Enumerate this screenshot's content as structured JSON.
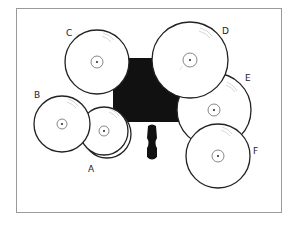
{
  "diagram": {
    "type": "drum-kit-cymbal-layout",
    "colors": {
      "outline": "#222222",
      "fill": "#ffffff",
      "drum_mass": "#111111",
      "frame": "#9a9a9a",
      "groove": "#bbbbbb"
    },
    "cymbals": [
      {
        "label": "A",
        "cx": 104,
        "cy": 131,
        "r": 24,
        "double": true
      },
      {
        "label": "B",
        "cx": 62,
        "cy": 124,
        "r": 28
      },
      {
        "label": "C",
        "cx": 97,
        "cy": 62,
        "r": 32
      },
      {
        "label": "D",
        "cx": 190,
        "cy": 60,
        "r": 38
      },
      {
        "label": "E",
        "cx": 214,
        "cy": 110,
        "r": 37
      },
      {
        "label": "F",
        "cx": 218,
        "cy": 156,
        "r": 32
      }
    ],
    "labels": {
      "A": "A",
      "B": "B",
      "C": "C",
      "D": "D",
      "E": "E",
      "F": "F"
    }
  }
}
